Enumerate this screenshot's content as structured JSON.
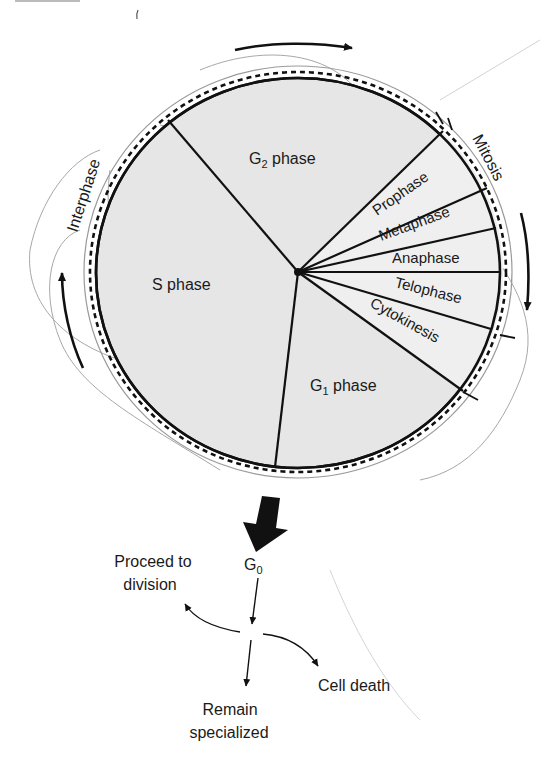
{
  "diagram": {
    "outer_labels": {
      "interphase": "Interphase",
      "mitosis": "Mitosis"
    },
    "phases": [
      {
        "id": "g2",
        "label": "G",
        "sub": "2",
        "suffix": " phase"
      },
      {
        "id": "s",
        "label": "S phase"
      },
      {
        "id": "g1",
        "label": "G",
        "sub": "1",
        "suffix": " phase"
      },
      {
        "id": "prophase",
        "label": "Prophase"
      },
      {
        "id": "metaphase",
        "label": "Metaphase"
      },
      {
        "id": "anaphase",
        "label": "Anaphase"
      },
      {
        "id": "telophase",
        "label": "Telophase"
      },
      {
        "id": "cytokinesis",
        "label": "Cytokinesis"
      }
    ],
    "g0": {
      "label": "G",
      "sub": "0"
    },
    "outcomes": {
      "proceed_line1": "Proceed to",
      "proceed_line2": "division",
      "remain_line1": "Remain",
      "remain_line2": "specialized",
      "death": "Cell death"
    },
    "colors": {
      "fill": "#e6e6e6",
      "mitosis_fill": "#ececec",
      "line": "#111111",
      "pencil": "#8a8a8a"
    }
  }
}
